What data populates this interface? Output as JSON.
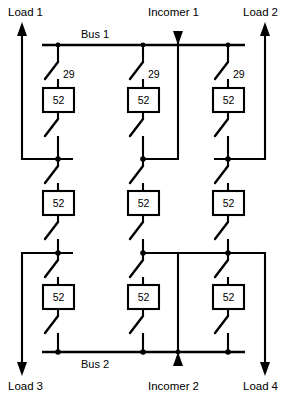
{
  "diagram": {
    "title_terms": {
      "load_1": {
        "lead": "Load",
        "num": "1"
      },
      "load_2": {
        "lead": "Load",
        "num": "2"
      },
      "load_3": {
        "lead": "Load",
        "num": "3"
      },
      "load_4": {
        "lead": "Load",
        "num": "4"
      },
      "incomer_1": {
        "lead": "Incomer",
        "num": "1"
      },
      "incomer_2": {
        "lead": "Incomer",
        "num": "2"
      }
    },
    "buses": {
      "bus_1": {
        "lead": "Bus",
        "num": "1"
      },
      "bus_2": {
        "lead": "Bus",
        "num": "2"
      }
    },
    "device_labels": {
      "breaker": "52",
      "isolator": "29"
    },
    "breakers": [
      {
        "label": "52",
        "row": "top",
        "column": "left"
      },
      {
        "label": "52",
        "row": "top",
        "column": "center"
      },
      {
        "label": "52",
        "row": "top",
        "column": "right"
      },
      {
        "label": "52",
        "row": "middle",
        "column": "left"
      },
      {
        "label": "52",
        "row": "middle",
        "column": "center"
      },
      {
        "label": "52",
        "row": "middle",
        "column": "right"
      },
      {
        "label": "52",
        "row": "bottom",
        "column": "left"
      },
      {
        "label": "52",
        "row": "bottom",
        "column": "center"
      },
      {
        "label": "52",
        "row": "bottom",
        "column": "right"
      }
    ],
    "isolator_labels": [
      {
        "label": "29",
        "column": "left"
      },
      {
        "label": "29",
        "column": "center"
      },
      {
        "label": "29",
        "column": "right"
      }
    ],
    "colors": {
      "line": "#000000",
      "background": "#ffffff",
      "device_fill": "#ffffff"
    }
  }
}
